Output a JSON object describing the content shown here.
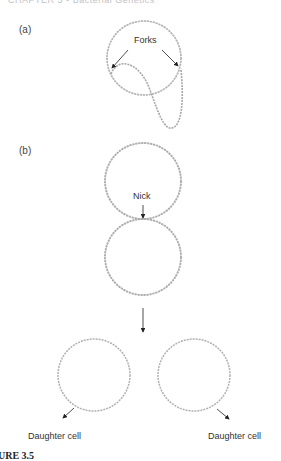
{
  "header": {
    "running_head": "CHAPTER 3 • Bacterial Genetics"
  },
  "panels": [
    {
      "id": "a",
      "label": "(a)",
      "annotation": "Forks"
    },
    {
      "id": "b",
      "label": "(b)",
      "annotation": "Nick",
      "products": [
        "Daughter cell",
        "Daughter cell"
      ]
    }
  ],
  "caption": {
    "figure_label": "URE 3.5"
  },
  "colors": {
    "dna_strand": "#9a9a9a",
    "arrow": "#222222",
    "text": "#333333"
  }
}
